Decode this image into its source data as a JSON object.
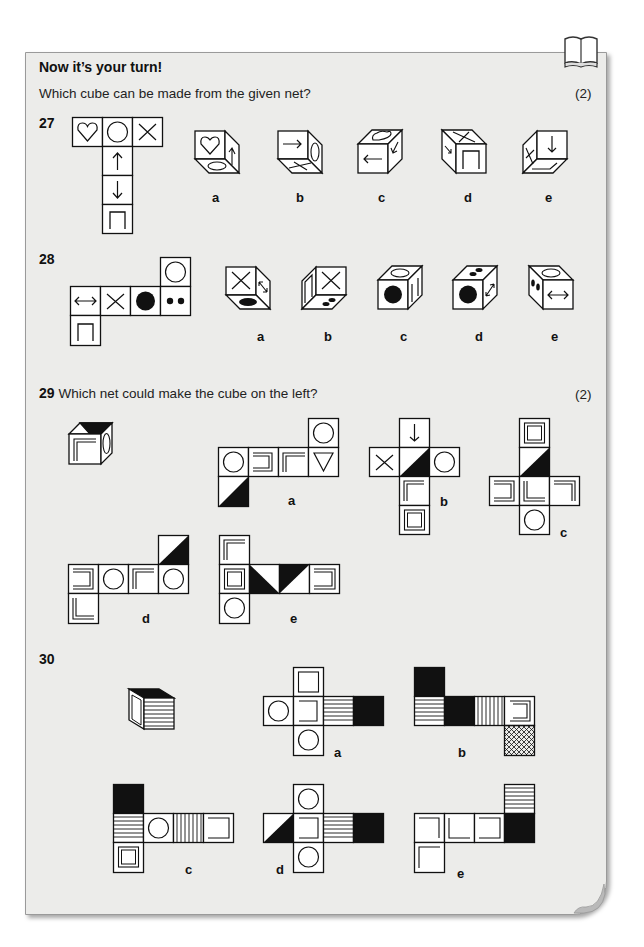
{
  "page": {
    "heading": "Now it’s your turn!",
    "instruction": "Which cube can be made from the given net?",
    "marks_27_28": "(2)",
    "book_icon": "open-book-icon",
    "panel_background": "#ececea"
  },
  "questions": [
    {
      "number": "27",
      "net_faces": [
        "heart",
        "circle",
        "cross",
        "arrow-up",
        "arrow-down",
        "open-square"
      ],
      "options": [
        {
          "label": "a",
          "faces": [
            "heart",
            "arrow-up",
            "ellipse"
          ]
        },
        {
          "label": "b",
          "faces": [
            "arrow-right",
            "ellipse",
            "cross"
          ]
        },
        {
          "label": "c",
          "faces": [
            "heart",
            "arrow-left",
            "arrow-diagonal"
          ]
        },
        {
          "label": "d",
          "faces": [
            "cross",
            "arrow-diagonal",
            "open-square"
          ]
        },
        {
          "label": "e",
          "faces": [
            "cross",
            "arrow-down",
            "open-square"
          ]
        }
      ]
    },
    {
      "number": "28",
      "net_faces": [
        "circle",
        "double-arrow",
        "cross",
        "black-dot",
        "two-dots",
        "open-square"
      ],
      "options": [
        {
          "label": "a",
          "faces": [
            "cross",
            "double-arrow",
            "black-dot"
          ]
        },
        {
          "label": "b",
          "faces": [
            "open-square",
            "cross",
            "two-dots"
          ]
        },
        {
          "label": "c",
          "faces": [
            "circle",
            "black-dot",
            "open-square"
          ]
        },
        {
          "label": "d",
          "faces": [
            "two-dots",
            "black-dot",
            "double-arrow"
          ]
        },
        {
          "label": "e",
          "faces": [
            "circle",
            "two-dots",
            "double-arrow"
          ]
        }
      ]
    },
    {
      "number": "29",
      "text": "Which net could make the cube on the left?",
      "marks": "(2)",
      "options": [
        {
          "label": "a"
        },
        {
          "label": "b"
        },
        {
          "label": "c"
        },
        {
          "label": "d"
        },
        {
          "label": "e"
        }
      ]
    },
    {
      "number": "30",
      "options": [
        {
          "label": "a"
        },
        {
          "label": "b"
        },
        {
          "label": "c"
        },
        {
          "label": "d"
        },
        {
          "label": "e"
        }
      ]
    }
  ]
}
